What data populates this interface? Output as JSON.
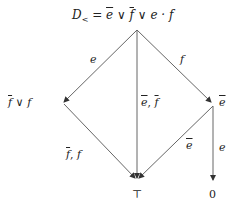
{
  "diagram": {
    "nodes": {
      "top": {
        "label_prefix": "D",
        "label_sub": "<",
        "label_rest": " = ",
        "e": "e",
        "or1": " ∨ ",
        "f": "f",
        "or2": " ∨ ",
        "ef": "e · f"
      },
      "left": {
        "f": "f",
        "or": " ∨ ",
        "f2": "f"
      },
      "right": {
        "e": "e"
      },
      "bottom": {
        "label": "⊤"
      },
      "zero": {
        "label": "0"
      }
    },
    "edges": {
      "top_left": "e",
      "top_right": "f",
      "top_bottom_e": "e",
      "top_bottom_sep": ", ",
      "top_bottom_f": "f",
      "left_bottom_f": "f",
      "left_bottom_sep": ", ",
      "left_bottom_f2": "f",
      "right_bottom": "e",
      "right_zero": "e"
    },
    "colors": {
      "line": "#555555",
      "text": "#222222"
    }
  }
}
